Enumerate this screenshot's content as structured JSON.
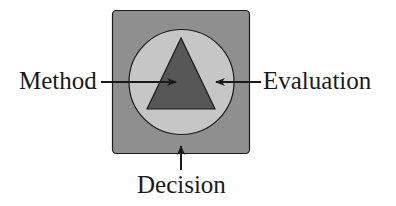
{
  "diagram": {
    "labels": {
      "method": "Method",
      "evaluation": "Evaluation",
      "decision": "Decision"
    },
    "shapes": {
      "outer_square": {
        "fill": "#8f8f8f",
        "stroke": "#1a1a1a"
      },
      "circle": {
        "fill": "#c6c6c6",
        "stroke": "#1a1a1a"
      },
      "triangle": {
        "fill": "#575757",
        "stroke": "#1a1a1a"
      }
    },
    "arrows": [
      {
        "from": "Method",
        "direction": "right",
        "target": "triangle"
      },
      {
        "from": "Evaluation",
        "direction": "left",
        "target": "circle"
      },
      {
        "from": "Decision",
        "direction": "up",
        "target": "outer_square"
      }
    ]
  }
}
